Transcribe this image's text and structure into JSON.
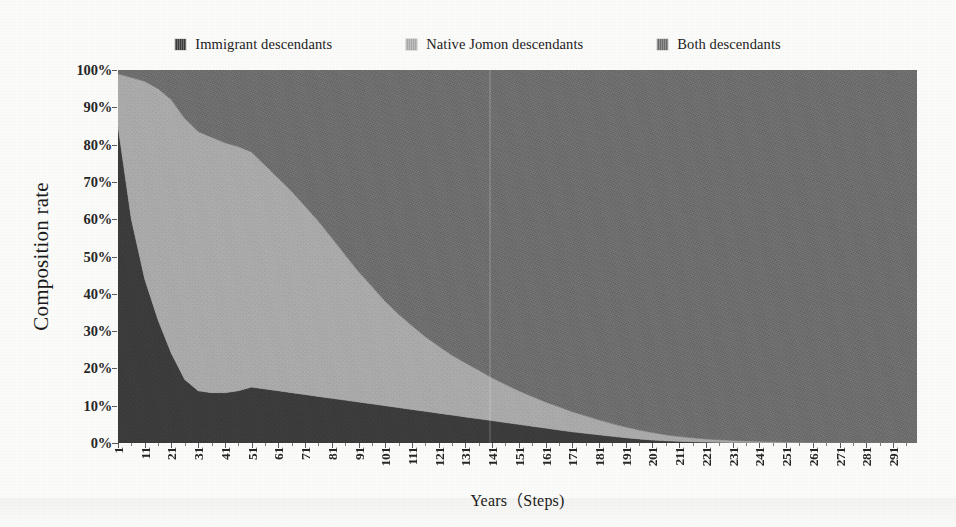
{
  "legend": {
    "position": "top-center",
    "items": [
      {
        "label": "Immigrant descendants",
        "color": "#3a3a3a",
        "icon": "legend-swatch-icon"
      },
      {
        "label": "Native Jomon descendants",
        "color": "#a8a8a8",
        "icon": "legend-swatch-icon"
      },
      {
        "label": "Both descendants",
        "color": "#6b6b6b",
        "icon": "legend-swatch-icon"
      }
    ]
  },
  "axes": {
    "y_title": "Composition rate",
    "x_title": "Years（Steps)",
    "y_ticks": [
      "100%",
      "90%",
      "80%",
      "70%",
      "60%",
      "50%",
      "40%",
      "30%",
      "20%",
      "10%",
      "0%"
    ],
    "x_ticks": [
      "1",
      "11",
      "21",
      "31",
      "41",
      "51",
      "61",
      "71",
      "81",
      "91",
      "101",
      "111",
      "121",
      "131",
      "141",
      "151",
      "161",
      "171",
      "181",
      "191",
      "201",
      "211",
      "221",
      "231",
      "241",
      "251",
      "261",
      "271",
      "281",
      "291"
    ]
  },
  "chart_data": {
    "type": "area",
    "stacked": true,
    "normalized": true,
    "title": "",
    "xlabel": "Years（Steps)",
    "ylabel": "Composition rate",
    "xlim": [
      1,
      300
    ],
    "ylim": [
      0,
      100
    ],
    "grid": false,
    "legend_position": "top-center",
    "x": [
      1,
      6,
      11,
      16,
      21,
      26,
      31,
      36,
      41,
      46,
      51,
      56,
      61,
      66,
      71,
      76,
      81,
      86,
      91,
      96,
      101,
      106,
      111,
      116,
      121,
      126,
      131,
      136,
      141,
      146,
      151,
      156,
      161,
      166,
      171,
      176,
      181,
      186,
      191,
      196,
      201,
      206,
      211,
      216,
      221,
      226,
      231,
      236,
      241,
      246,
      251,
      256,
      261,
      266,
      271,
      276,
      281,
      286,
      291,
      296,
      300
    ],
    "series": [
      {
        "name": "Immigrant descendants",
        "color": "#3a3a3a",
        "values": [
          85,
          60,
          44,
          33,
          24,
          17,
          14,
          13.5,
          13.5,
          14,
          15,
          14.5,
          14,
          13.5,
          13,
          12.5,
          12,
          11.5,
          11,
          10.5,
          10,
          9.5,
          9,
          8.5,
          8,
          7.5,
          7,
          6.5,
          6,
          5.5,
          5,
          4.5,
          4,
          3.5,
          3,
          2.6,
          2.2,
          1.8,
          1.4,
          1.1,
          0.8,
          0.6,
          0.45,
          0.35,
          0.25,
          0.2,
          0.15,
          0.12,
          0.1,
          0.08,
          0.06,
          0.05,
          0.04,
          0.03,
          0.03,
          0.02,
          0.02,
          0.02,
          0.01,
          0.01,
          0.01
        ]
      },
      {
        "name": "Native Jomon descendants",
        "color": "#a8a8a8",
        "values": [
          14,
          38,
          53,
          62,
          68,
          70,
          69.5,
          68.5,
          67,
          65.5,
          63,
          60,
          57,
          54,
          50.5,
          47,
          43,
          39,
          35,
          31.5,
          28,
          25,
          22.5,
          20,
          18,
          16,
          14.5,
          13,
          11.5,
          10.2,
          9,
          8,
          7,
          6.2,
          5.4,
          4.7,
          4,
          3.4,
          2.9,
          2.4,
          2,
          1.6,
          1.3,
          1.05,
          0.85,
          0.68,
          0.55,
          0.44,
          0.35,
          0.28,
          0.22,
          0.18,
          0.14,
          0.11,
          0.09,
          0.07,
          0.05,
          0.04,
          0.03,
          0.02,
          0.02
        ]
      },
      {
        "name": "Both descendants",
        "color": "#6b6b6b",
        "values": [
          1,
          2,
          3,
          5,
          8,
          13,
          16.5,
          18,
          19.5,
          20.5,
          22,
          25.5,
          29,
          32.5,
          36.5,
          40.5,
          45,
          49.5,
          54,
          58,
          62,
          65.5,
          68.5,
          71.5,
          74,
          76.5,
          78.5,
          80.5,
          82.5,
          84.3,
          86,
          87.5,
          89,
          90.3,
          91.6,
          92.7,
          93.8,
          94.8,
          95.7,
          96.5,
          97.2,
          97.8,
          98.25,
          98.6,
          98.9,
          99.12,
          99.3,
          99.44,
          99.55,
          99.64,
          99.72,
          99.77,
          99.82,
          99.86,
          99.88,
          99.91,
          99.93,
          99.94,
          99.96,
          99.97,
          99.97
        ]
      }
    ]
  }
}
